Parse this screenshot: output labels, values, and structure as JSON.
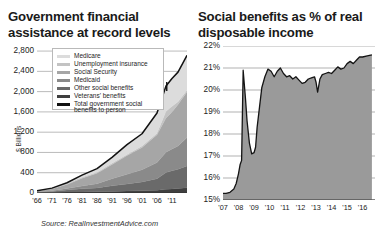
{
  "left": {
    "title": "Government financial assistance at record levels",
    "axis_title": "$ Billions",
    "source": "Source: RealInvestmentAdvice.com",
    "legend": [
      {
        "label": "Medicare",
        "color": "#dcdcdc"
      },
      {
        "label": "Unemployment insurance",
        "color": "#c3c3c3"
      },
      {
        "label": "Social Security",
        "color": "#a6a6a6"
      },
      {
        "label": "Medicaid",
        "color": "#8a8a8a"
      },
      {
        "label": "Other social benefits",
        "color": "#6a6a6a"
      },
      {
        "label": "Veterans' benefits",
        "color": "#3f3f3f"
      },
      {
        "label": "Total government social benefits to person",
        "color": "#121212"
      }
    ]
  },
  "right": {
    "title": "Social benefits as % of real disposable income"
  },
  "chart_data": [
    {
      "type": "area",
      "stacked": true,
      "title": "Government financial assistance at record levels",
      "xlabel": "",
      "ylabel": "$ Billions",
      "ylim": [
        0,
        2900
      ],
      "yticks": [
        0,
        400,
        800,
        1200,
        1600,
        2000,
        2400,
        2800
      ],
      "ytick_labels": [
        "0",
        "400",
        "800",
        "1,200",
        "1,600",
        "2,000",
        "2,400",
        "2,800"
      ],
      "xlim": [
        1966,
        2016
      ],
      "xticks": [
        1966,
        1971,
        1976,
        1981,
        1986,
        1991,
        1996,
        2001,
        2006,
        2011
      ],
      "xtick_labels": [
        "'66",
        "'71",
        "'76",
        "'81",
        "'86",
        "'91",
        "'96",
        "'01",
        "'06",
        "'11"
      ],
      "grid": true,
      "legend_position": "upper-left-inset",
      "x": [
        1966,
        1971,
        1976,
        1981,
        1986,
        1991,
        1996,
        2001,
        2006,
        2009,
        2011,
        2013,
        2016
      ],
      "series": [
        {
          "name": "Veterans' benefits",
          "color": "#3f3f3f",
          "values": [
            6,
            10,
            18,
            22,
            26,
            31,
            38,
            44,
            52,
            72,
            80,
            90,
            104
          ]
        },
        {
          "name": "Other social benefits",
          "color": "#6a6a6a",
          "values": [
            10,
            20,
            40,
            60,
            75,
            110,
            140,
            175,
            230,
            330,
            360,
            380,
            430
          ]
        },
        {
          "name": "Medicaid",
          "color": "#8a8a8a",
          "values": [
            2,
            12,
            30,
            55,
            80,
            140,
            190,
            240,
            320,
            400,
            430,
            455,
            560
          ]
        },
        {
          "name": "Social Security",
          "color": "#a6a6a6",
          "values": [
            22,
            40,
            80,
            155,
            210,
            280,
            370,
            440,
            545,
            680,
            730,
            820,
            900
          ]
        },
        {
          "name": "Unemployment insurance",
          "color": "#c3c3c3",
          "values": [
            2,
            6,
            18,
            18,
            18,
            27,
            22,
            30,
            32,
            130,
            110,
            55,
            32
          ]
        },
        {
          "name": "Medicare",
          "color": "#dcdcdc",
          "values": [
            2,
            8,
            17,
            42,
            72,
            115,
            195,
            240,
            400,
            500,
            550,
            585,
            690
          ]
        }
      ],
      "total_line": {
        "name": "Total government social benefits to person",
        "color": "#121212",
        "values": [
          44,
          96,
          203,
          352,
          481,
          703,
          955,
          1169,
          1579,
          2112,
          2260,
          2385,
          2716
        ]
      }
    },
    {
      "type": "area",
      "title": "Social benefits as % of real disposable income",
      "xlabel": "",
      "ylabel": "%",
      "ylim": [
        15,
        22
      ],
      "yticks": [
        15,
        16,
        17,
        18,
        19,
        20,
        21,
        22
      ],
      "ytick_labels": [
        "15%",
        "16%",
        "17%",
        "18%",
        "19%",
        "20%",
        "21%",
        "22%"
      ],
      "xlim": [
        2007,
        2016.8
      ],
      "xticks": [
        2007,
        2008,
        2009,
        2010,
        2011,
        2012,
        2013,
        2014,
        2015,
        2016
      ],
      "xtick_labels": [
        "'07",
        "'08",
        "'09",
        "'10",
        "'11",
        "'12",
        "'13",
        "'14",
        "'15",
        "'16"
      ],
      "grid": true,
      "fill_color": "#9a9a9a",
      "line_color": "#141414",
      "x": [
        2007.0,
        2007.2,
        2007.45,
        2007.7,
        2007.85,
        2008.0,
        2008.1,
        2008.2,
        2008.3,
        2008.45,
        2008.55,
        2008.7,
        2008.85,
        2009.0,
        2009.1,
        2009.2,
        2009.35,
        2009.5,
        2009.7,
        2009.9,
        2010.1,
        2010.3,
        2010.5,
        2010.7,
        2010.9,
        2011.1,
        2011.3,
        2011.5,
        2011.7,
        2011.9,
        2012.1,
        2012.3,
        2012.5,
        2012.7,
        2012.9,
        2013.0,
        2013.1,
        2013.25,
        2013.4,
        2013.6,
        2013.8,
        2014.0,
        2014.2,
        2014.4,
        2014.6,
        2014.8,
        2015.0,
        2015.2,
        2015.4,
        2015.6,
        2015.8,
        2016.0,
        2016.3,
        2016.6
      ],
      "values": [
        15.3,
        15.3,
        15.35,
        15.5,
        15.75,
        16.2,
        16.6,
        16.8,
        20.9,
        19.6,
        18.6,
        17.6,
        17.1,
        17.15,
        17.4,
        18.3,
        19.2,
        20.1,
        20.6,
        20.95,
        20.85,
        20.6,
        20.85,
        21.0,
        20.75,
        20.6,
        20.65,
        20.5,
        20.6,
        20.45,
        20.3,
        20.35,
        20.5,
        20.55,
        20.6,
        20.35,
        19.9,
        20.5,
        20.7,
        20.75,
        20.8,
        20.75,
        20.9,
        21.05,
        20.95,
        21.0,
        21.2,
        21.3,
        21.2,
        21.35,
        21.5,
        21.5,
        21.55,
        21.6
      ]
    }
  ]
}
